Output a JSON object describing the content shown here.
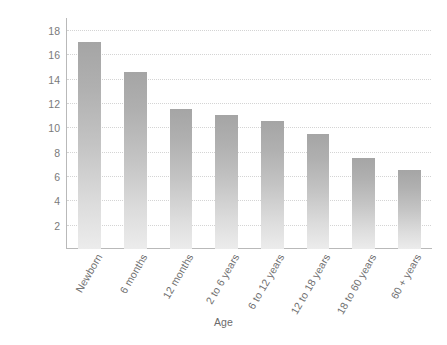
{
  "chart_data": {
    "type": "bar",
    "title": "",
    "xlabel": "Age",
    "ylabel": "Hours of Sleep",
    "categories": [
      "Newborn",
      "6 months",
      "12 months",
      "2 to 6 years",
      "6 to 12 years",
      "12 to 18 years",
      "18 to 60 years",
      "60 + years"
    ],
    "values": [
      17,
      14.6,
      11.5,
      11,
      10.5,
      9.5,
      7.5,
      6.5
    ],
    "ylim": [
      0,
      19
    ],
    "yticks": [
      2,
      4,
      6,
      8,
      10,
      12,
      14,
      16,
      18
    ],
    "ytick_labels": [
      "2",
      "4",
      "6",
      "8",
      "10",
      "12",
      "14",
      "16",
      "18"
    ],
    "grid": "horizontal-dotted",
    "legend": "none",
    "bar_color_top": "#a5a5a5",
    "bar_color_bottom": "#ececec",
    "axis_color": "#b9b9b9",
    "gridline_color": "#d4d4d4",
    "text_color": "#6e6e6e",
    "background": "#ffffff"
  }
}
